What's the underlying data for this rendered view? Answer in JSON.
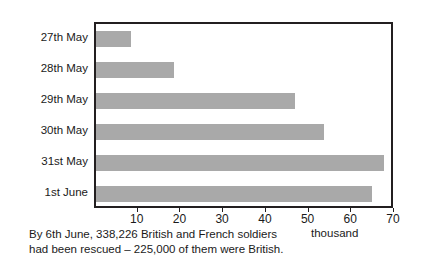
{
  "chart_data": {
    "type": "bar",
    "orientation": "horizontal",
    "title": "",
    "xlabel": "thousand",
    "ylabel": "",
    "xlim": [
      0,
      70
    ],
    "xticks": [
      10,
      20,
      30,
      40,
      50,
      60,
      70
    ],
    "grid": false,
    "legend": null,
    "categories": [
      "27th May",
      "28th May",
      "29th May",
      "30th May",
      "31st May",
      "1st June"
    ],
    "values": [
      8.2,
      18.3,
      46.6,
      53.4,
      67.4,
      64.5
    ],
    "bar_color": "#a9a9a9",
    "frame_color": "#231f20",
    "background": "#ffffff"
  },
  "axis": {
    "unit_label": "thousand",
    "tick_labels": [
      "10",
      "20",
      "30",
      "40",
      "50",
      "60",
      "70"
    ]
  },
  "caption": {
    "line1": "By 6th June, 338,226 British and French soldiers",
    "line2": "had been rescued – 225,000 of them were British."
  }
}
